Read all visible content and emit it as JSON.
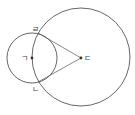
{
  "diagram": {
    "type": "geometry",
    "colors": {
      "stroke": "#555555",
      "point": "#333333",
      "background": "#ffffff"
    },
    "small_circle": {
      "center_label": "ㄱ",
      "cx": 32,
      "cy": 58,
      "r": 25
    },
    "large_circle": {
      "center_label": "ㄷ",
      "cx": 81,
      "cy": 57,
      "r": 49
    },
    "points": [
      {
        "label": "ㄱ",
        "x": 32,
        "y": 58,
        "role": "center of small circle"
      },
      {
        "label": "ㄴ",
        "x": 38,
        "y": 82,
        "role": "lower intersection"
      },
      {
        "label": "ㄷ",
        "x": 81,
        "y": 58,
        "role": "center of large circle"
      },
      {
        "label": "ㄹ",
        "x": 38,
        "y": 33,
        "role": "upper intersection"
      }
    ],
    "segments": [
      {
        "from": "ㄹ",
        "to": "ㄷ"
      },
      {
        "from": "ㄴ",
        "to": "ㄷ"
      }
    ],
    "labels": {
      "g": "ㄱ",
      "n": "ㄴ",
      "d": "ㄷ",
      "r": "ㄹ"
    }
  }
}
